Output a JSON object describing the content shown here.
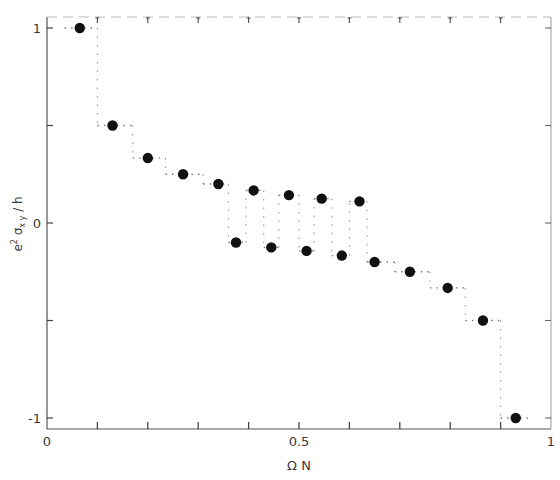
{
  "chart_data": {
    "type": "scatter",
    "title": "",
    "xlabel": "Ω N",
    "ylabel": "e² σxy / h",
    "xlim": [
      0,
      1
    ],
    "ylim": [
      -1,
      1
    ],
    "grid": false,
    "legend": null,
    "x_tick_labels": [
      {
        "value": 0,
        "label": "0"
      },
      {
        "value": 0.5,
        "label": "0.5"
      },
      {
        "value": 1,
        "label": "1"
      }
    ],
    "x_minor_ticks": [
      0.1,
      0.2,
      0.3,
      0.4,
      0.6,
      0.7,
      0.8,
      0.9
    ],
    "y_tick_labels": [
      {
        "value": 1,
        "label": "1"
      },
      {
        "value": 0,
        "label": "0"
      },
      {
        "value": -1,
        "label": "-1"
      }
    ],
    "y_minor_ticks": [
      0.5,
      -0.5
    ],
    "series": [
      {
        "name": "Hall conductance",
        "marker": "filled-circle",
        "color": "#111111",
        "points": [
          {
            "x": 0.065,
            "y": 1.0
          },
          {
            "x": 0.13,
            "y": 0.5
          },
          {
            "x": 0.2,
            "y": 0.333
          },
          {
            "x": 0.27,
            "y": 0.25
          },
          {
            "x": 0.34,
            "y": 0.2
          },
          {
            "x": 0.375,
            "y": -0.1
          },
          {
            "x": 0.41,
            "y": 0.167
          },
          {
            "x": 0.445,
            "y": -0.125
          },
          {
            "x": 0.48,
            "y": 0.143
          },
          {
            "x": 0.515,
            "y": -0.143
          },
          {
            "x": 0.545,
            "y": 0.125
          },
          {
            "x": 0.585,
            "y": -0.167
          },
          {
            "x": 0.62,
            "y": 0.111
          },
          {
            "x": 0.65,
            "y": -0.2
          },
          {
            "x": 0.72,
            "y": -0.25
          },
          {
            "x": 0.795,
            "y": -0.333
          },
          {
            "x": 0.865,
            "y": -0.5
          },
          {
            "x": 0.93,
            "y": -1.0
          }
        ]
      }
    ],
    "step_guides": [
      {
        "x0": 0.035,
        "x1": 0.1,
        "y": 1.0
      },
      {
        "x0": 0.1,
        "x1": 0.17,
        "y": 0.5
      },
      {
        "x0": 0.17,
        "x1": 0.235,
        "y": 0.333
      },
      {
        "x0": 0.235,
        "x1": 0.31,
        "y": 0.25
      },
      {
        "x0": 0.31,
        "x1": 0.36,
        "y": 0.2
      },
      {
        "x0": 0.36,
        "x1": 0.395,
        "y": -0.1
      },
      {
        "x0": 0.395,
        "x1": 0.43,
        "y": 0.167
      },
      {
        "x0": 0.43,
        "x1": 0.46,
        "y": -0.125
      },
      {
        "x0": 0.46,
        "x1": 0.5,
        "y": 0.143
      },
      {
        "x0": 0.5,
        "x1": 0.53,
        "y": -0.143
      },
      {
        "x0": 0.53,
        "x1": 0.565,
        "y": 0.125
      },
      {
        "x0": 0.565,
        "x1": 0.6,
        "y": -0.167
      },
      {
        "x0": 0.6,
        "x1": 0.635,
        "y": 0.111
      },
      {
        "x0": 0.635,
        "x1": 0.69,
        "y": -0.2
      },
      {
        "x0": 0.69,
        "x1": 0.76,
        "y": -0.25
      },
      {
        "x0": 0.76,
        "x1": 0.83,
        "y": -0.333
      },
      {
        "x0": 0.83,
        "x1": 0.9,
        "y": -0.5
      },
      {
        "x0": 0.9,
        "x1": 0.96,
        "y": -1.0
      }
    ]
  },
  "axes": {
    "x_title": "Ω N",
    "y_title_parts": {
      "base": "e",
      "sup": "2",
      "mid": " σ",
      "sub": "x y",
      "tail": " / h"
    }
  }
}
